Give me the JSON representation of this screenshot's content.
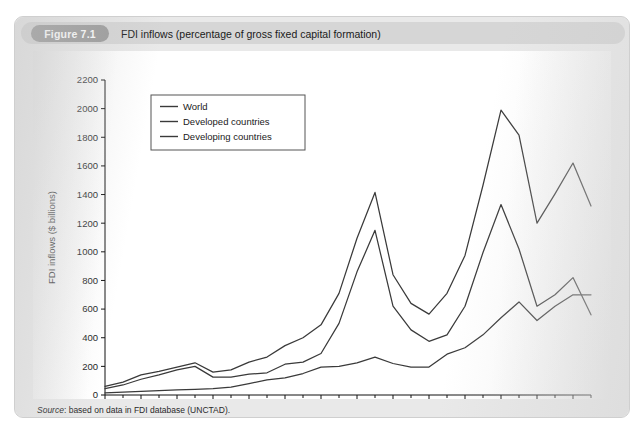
{
  "running_head": "",
  "figure": {
    "badge": "Figure 7.1",
    "caption": "FDI inflows (percentage of gross fixed capital formation)",
    "source_prefix": "Source",
    "source_text": ": based on data in FDI database (UNCTAD)."
  },
  "chart_data": {
    "type": "line",
    "title": "FDI inflows (percentage of gross fixed capital formation)",
    "xlabel": "",
    "ylabel": "FDI inflows ($ billions)",
    "xlim": [
      1985,
      2012
    ],
    "ylim": [
      0,
      2200
    ],
    "ytick_step": 200,
    "yticks": [
      0,
      200,
      400,
      600,
      800,
      1000,
      1200,
      1400,
      1600,
      1800,
      2000,
      2200
    ],
    "xticks_major": [
      1985,
      1987,
      1989,
      1991,
      1993,
      1995,
      1997,
      1999,
      2001,
      2003,
      2005,
      2007,
      2009,
      2011
    ],
    "xticks_minor": [
      1986,
      1988,
      1990,
      1992,
      1994,
      1996,
      1998,
      2000,
      2002,
      2004,
      2006,
      2008,
      2010,
      2012
    ],
    "grid": false,
    "legend_position": "upper left",
    "x": [
      1985,
      1986,
      1987,
      1988,
      1989,
      1990,
      1991,
      1992,
      1993,
      1994,
      1995,
      1996,
      1997,
      1998,
      1999,
      2000,
      2001,
      2002,
      2003,
      2004,
      2005,
      2006,
      2007,
      2008,
      2009,
      2010,
      2011,
      2012
    ],
    "series": [
      {
        "name": "World",
        "values": [
          60,
          90,
          140,
          165,
          195,
          225,
          160,
          175,
          230,
          265,
          345,
          400,
          490,
          710,
          1095,
          1415,
          840,
          640,
          565,
          710,
          975,
          1465,
          1990,
          1815,
          1200,
          1405,
          1620,
          1320
        ]
      },
      {
        "name": "Developed countries",
        "values": [
          45,
          70,
          110,
          140,
          175,
          200,
          125,
          125,
          145,
          155,
          215,
          230,
          290,
          500,
          860,
          1150,
          620,
          455,
          375,
          420,
          620,
          995,
          1330,
          1020,
          620,
          700,
          820,
          560
        ]
      },
      {
        "name": "Developing countries",
        "values": [
          15,
          20,
          25,
          30,
          35,
          40,
          45,
          55,
          80,
          105,
          120,
          150,
          195,
          200,
          225,
          265,
          220,
          195,
          195,
          285,
          330,
          420,
          540,
          650,
          520,
          620,
          700,
          700
        ]
      }
    ]
  },
  "legend": {
    "items": [
      {
        "label": "World"
      },
      {
        "label": "Developed countries"
      },
      {
        "label": "Developing countries"
      }
    ]
  },
  "colors": {
    "panel": "#e9e9e9",
    "caption_bar": "#d6d6d6",
    "badge": "#9a9a9a",
    "plot_bg": "#ffffff",
    "line": "#3a3a3a",
    "axis": "#111111"
  }
}
